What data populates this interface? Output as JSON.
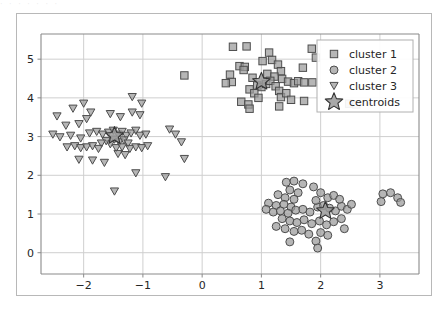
{
  "figure": {
    "background_color": "#ffffff",
    "frame_color": "#b8b8b8",
    "grid_color": "#cfcfcf",
    "axis_color": "#8a8a8a",
    "top_artifact_text": "· · ·      · ·   · ·"
  },
  "chart_data": {
    "type": "scatter",
    "title": "",
    "xlabel": "",
    "ylabel": "",
    "xlim": [
      -2.72,
      3.66
    ],
    "ylim": [
      -0.55,
      5.65
    ],
    "xticks": [
      -2,
      -1,
      0,
      1,
      2,
      3
    ],
    "xticklabels": [
      "−2",
      "−1",
      "0",
      "1",
      "2",
      "3"
    ],
    "yticks": [
      0,
      1,
      2,
      3,
      4,
      5
    ],
    "yticklabels": [
      "0",
      "1",
      "2",
      "3",
      "4",
      "5"
    ],
    "grid": true,
    "legend_position": "upper right",
    "marker_face_color": "#9a9a9a",
    "marker_edge_color": "#4d4d4d",
    "centroid_face_color": "#9a9a9a",
    "centroid_edge_color": "#333333",
    "legend": [
      {
        "label": "cluster 1",
        "marker": "square"
      },
      {
        "label": "cluster 2",
        "marker": "circle"
      },
      {
        "label": "cluster 3",
        "marker": "triangle-down"
      },
      {
        "label": "centroids",
        "marker": "star"
      }
    ],
    "series": [
      {
        "name": "cluster 1",
        "marker": "square",
        "points": [
          [
            0.52,
            5.32
          ],
          [
            0.75,
            5.33
          ],
          [
            1.13,
            5.17
          ],
          [
            1.18,
            4.98
          ],
          [
            1.85,
            5.27
          ],
          [
            1.92,
            5.04
          ],
          [
            0.63,
            4.82
          ],
          [
            0.72,
            4.8
          ],
          [
            0.7,
            4.72
          ],
          [
            1.28,
            4.86
          ],
          [
            1.33,
            4.69
          ],
          [
            1.7,
            4.78
          ],
          [
            1.02,
            4.95
          ],
          [
            0.47,
            4.6
          ],
          [
            0.5,
            4.41
          ],
          [
            0.85,
            4.52
          ],
          [
            1.1,
            4.62
          ],
          [
            1.22,
            4.55
          ],
          [
            1.35,
            4.49
          ],
          [
            1.45,
            4.42
          ],
          [
            1.55,
            4.38
          ],
          [
            1.62,
            4.43
          ],
          [
            1.72,
            4.4
          ],
          [
            1.86,
            4.4
          ],
          [
            0.93,
            4.32
          ],
          [
            1.0,
            4.28
          ],
          [
            1.08,
            4.36
          ],
          [
            1.15,
            4.44
          ],
          [
            1.24,
            4.3
          ],
          [
            0.8,
            4.22
          ],
          [
            0.88,
            4.12
          ],
          [
            1.3,
            4.18
          ],
          [
            1.33,
            4.02
          ],
          [
            1.42,
            4.12
          ],
          [
            0.66,
            3.9
          ],
          [
            0.78,
            3.83
          ],
          [
            0.8,
            3.72
          ],
          [
            0.95,
            4.0
          ],
          [
            1.5,
            3.95
          ],
          [
            1.72,
            3.92
          ],
          [
            1.3,
            3.78
          ],
          [
            2.22,
            3.88
          ],
          [
            2.48,
            3.85
          ],
          [
            2.6,
            3.83
          ],
          [
            -0.3,
            4.58
          ],
          [
            0.4,
            4.38
          ]
        ]
      },
      {
        "name": "cluster 2",
        "marker": "circle",
        "points": [
          [
            1.42,
            1.82
          ],
          [
            1.55,
            1.85
          ],
          [
            1.7,
            1.78
          ],
          [
            1.48,
            1.62
          ],
          [
            1.62,
            1.55
          ],
          [
            1.88,
            1.7
          ],
          [
            1.28,
            1.5
          ],
          [
            1.4,
            1.42
          ],
          [
            1.55,
            1.38
          ],
          [
            1.12,
            1.28
          ],
          [
            1.25,
            1.22
          ],
          [
            1.38,
            1.25
          ],
          [
            1.5,
            1.18
          ],
          [
            1.08,
            1.12
          ],
          [
            1.2,
            1.05
          ],
          [
            1.32,
            1.08
          ],
          [
            1.45,
            1.02
          ],
          [
            1.58,
            1.1
          ],
          [
            1.7,
            1.12
          ],
          [
            1.82,
            1.05
          ],
          [
            1.95,
            1.18
          ],
          [
            2.05,
            1.22
          ],
          [
            2.15,
            1.15
          ],
          [
            2.25,
            1.08
          ],
          [
            2.35,
            1.2
          ],
          [
            2.45,
            1.12
          ],
          [
            2.52,
            1.25
          ],
          [
            2.12,
            1.42
          ],
          [
            2.22,
            1.48
          ],
          [
            2.32,
            1.38
          ],
          [
            2.0,
            1.55
          ],
          [
            1.92,
            1.35
          ],
          [
            1.35,
            0.88
          ],
          [
            1.48,
            0.82
          ],
          [
            1.6,
            0.78
          ],
          [
            1.72,
            0.85
          ],
          [
            1.85,
            0.75
          ],
          [
            1.98,
            0.82
          ],
          [
            2.1,
            0.72
          ],
          [
            2.22,
            0.8
          ],
          [
            1.25,
            0.68
          ],
          [
            1.4,
            0.62
          ],
          [
            1.55,
            0.55
          ],
          [
            1.68,
            0.58
          ],
          [
            1.8,
            0.48
          ],
          [
            2.0,
            0.52
          ],
          [
            2.12,
            0.45
          ],
          [
            1.48,
            0.28
          ],
          [
            1.92,
            0.3
          ],
          [
            1.95,
            0.12
          ],
          [
            2.35,
            0.88
          ],
          [
            2.4,
            0.62
          ],
          [
            3.05,
            1.52
          ],
          [
            3.18,
            1.55
          ],
          [
            3.3,
            1.42
          ],
          [
            3.02,
            1.32
          ],
          [
            3.35,
            1.3
          ]
        ]
      },
      {
        "name": "cluster 3",
        "marker": "triangle-down",
        "points": [
          [
            -2.45,
            3.52
          ],
          [
            -2.18,
            3.72
          ],
          [
            -2.0,
            3.85
          ],
          [
            -1.88,
            3.62
          ],
          [
            -2.3,
            3.28
          ],
          [
            -2.08,
            3.32
          ],
          [
            -1.95,
            3.45
          ],
          [
            -1.55,
            3.58
          ],
          [
            -1.38,
            3.5
          ],
          [
            -1.18,
            3.62
          ],
          [
            -1.05,
            3.55
          ],
          [
            -2.52,
            3.05
          ],
          [
            -2.4,
            2.98
          ],
          [
            -2.22,
            3.02
          ],
          [
            -2.05,
            2.95
          ],
          [
            -1.9,
            3.08
          ],
          [
            -1.78,
            3.12
          ],
          [
            -1.68,
            3.05
          ],
          [
            -1.58,
            3.1
          ],
          [
            -1.5,
            3.15
          ],
          [
            -1.42,
            3.05
          ],
          [
            -1.35,
            3.12
          ],
          [
            -1.28,
            3.02
          ],
          [
            -1.2,
            3.08
          ],
          [
            -1.12,
            3.15
          ],
          [
            -1.05,
            3.02
          ],
          [
            -0.95,
            3.05
          ],
          [
            -1.48,
            2.92
          ],
          [
            -1.4,
            2.85
          ],
          [
            -1.32,
            2.9
          ],
          [
            -1.25,
            2.82
          ],
          [
            -1.55,
            2.8
          ],
          [
            -1.62,
            2.88
          ],
          [
            -1.7,
            2.82
          ],
          [
            -2.28,
            2.72
          ],
          [
            -2.15,
            2.75
          ],
          [
            -2.05,
            2.7
          ],
          [
            -1.95,
            2.72
          ],
          [
            -1.85,
            2.75
          ],
          [
            -1.75,
            2.68
          ],
          [
            -1.45,
            2.7
          ],
          [
            -1.35,
            2.72
          ],
          [
            -1.22,
            2.68
          ],
          [
            -1.12,
            2.72
          ],
          [
            -1.02,
            2.7
          ],
          [
            -0.92,
            2.75
          ],
          [
            -1.42,
            2.55
          ],
          [
            -1.3,
            2.52
          ],
          [
            -2.08,
            2.4
          ],
          [
            -1.85,
            2.38
          ],
          [
            -1.65,
            2.32
          ],
          [
            -0.55,
            3.18
          ],
          [
            -0.45,
            3.05
          ],
          [
            -0.35,
            2.85
          ],
          [
            -0.3,
            2.42
          ],
          [
            -0.62,
            1.95
          ],
          [
            -1.12,
            2.05
          ],
          [
            -1.48,
            1.58
          ],
          [
            -1.02,
            3.85
          ],
          [
            -1.18,
            4.02
          ]
        ]
      }
    ],
    "centroids": {
      "name": "centroids",
      "marker": "star",
      "points": [
        [
          1.0,
          4.42
        ],
        [
          2.08,
          1.08
        ],
        [
          -1.48,
          3.02
        ]
      ]
    }
  }
}
